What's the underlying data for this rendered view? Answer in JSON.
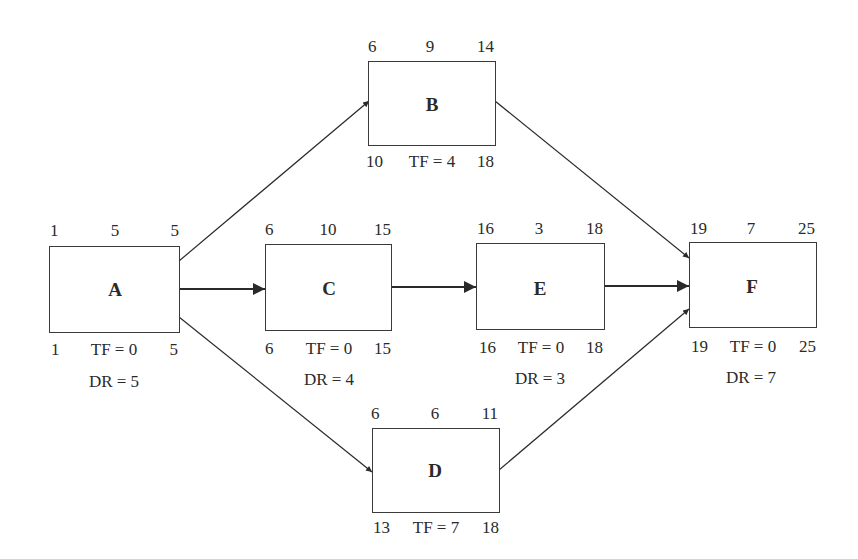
{
  "diagram": {
    "type": "activity-on-node network (CPM)",
    "nodes": {
      "A": {
        "label": "A",
        "es": "1",
        "dur": "5",
        "ef": "5",
        "ls": "1",
        "tf": "TF = 0",
        "lf": "5",
        "dr": "DR = 5"
      },
      "B": {
        "label": "B",
        "es": "6",
        "dur": "9",
        "ef": "14",
        "ls": "10",
        "tf": "TF = 4",
        "lf": "18",
        "dr": ""
      },
      "C": {
        "label": "C",
        "es": "6",
        "dur": "10",
        "ef": "15",
        "ls": "6",
        "tf": "TF = 0",
        "lf": "15",
        "dr": "DR = 4"
      },
      "D": {
        "label": "D",
        "es": "6",
        "dur": "6",
        "ef": "11",
        "ls": "13",
        "tf": "TF = 7",
        "lf": "18",
        "dr": ""
      },
      "E": {
        "label": "E",
        "es": "16",
        "dur": "3",
        "ef": "18",
        "ls": "16",
        "tf": "TF = 0",
        "lf": "18",
        "dr": "DR = 3"
      },
      "F": {
        "label": "F",
        "es": "19",
        "dur": "7",
        "ef": "25",
        "ls": "19",
        "tf": "TF = 0",
        "lf": "25",
        "dr": "DR = 7"
      }
    },
    "edges": [
      {
        "from": "A",
        "to": "B"
      },
      {
        "from": "A",
        "to": "C"
      },
      {
        "from": "A",
        "to": "D"
      },
      {
        "from": "C",
        "to": "E"
      },
      {
        "from": "B",
        "to": "F"
      },
      {
        "from": "E",
        "to": "F"
      },
      {
        "from": "D",
        "to": "F"
      }
    ]
  }
}
